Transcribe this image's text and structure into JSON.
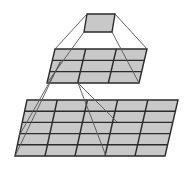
{
  "diagram": {
    "title": "",
    "colors": {
      "background": "#ffffff",
      "cell_fill": "#c8c8c8",
      "grid_line": "#2a2a2a",
      "connector_line": "#555555"
    },
    "layers": [
      {
        "name": "top-unit",
        "rows": 1,
        "cols": 1,
        "corners": {
          "tl": [
            87,
            14
          ],
          "tr": [
            115,
            14
          ],
          "br": [
            112,
            32
          ],
          "bl": [
            84,
            32
          ]
        }
      },
      {
        "name": "middle-layer",
        "rows": 3,
        "cols": 3,
        "corners": {
          "tl": [
            55,
            49
          ],
          "tr": [
            147,
            49
          ],
          "br": [
            139,
            83
          ],
          "bl": [
            47,
            83
          ]
        }
      },
      {
        "name": "bottom-layer",
        "rows": 5,
        "cols": 5,
        "corners": {
          "tl": [
            27,
            100
          ],
          "tr": [
            178,
            100
          ],
          "br": [
            165,
            156
          ],
          "bl": [
            15,
            156
          ]
        }
      }
    ],
    "connectors": [
      {
        "from": [
          87,
          14
        ],
        "to": [
          55,
          49
        ]
      },
      {
        "from": [
          115,
          14
        ],
        "to": [
          147,
          49
        ]
      },
      {
        "from": [
          84,
          32
        ],
        "to": [
          47,
          83
        ]
      },
      {
        "from": [
          112,
          32
        ],
        "to": [
          139,
          83
        ]
      },
      {
        "from": [
          62,
          60
        ],
        "to": [
          19,
          136
        ]
      },
      {
        "from": [
          60,
          62
        ],
        "to": [
          15,
          156
        ]
      },
      {
        "from": [
          78,
          83
        ],
        "to": [
          106,
          156
        ]
      },
      {
        "from": [
          78,
          83
        ],
        "to": [
          117,
          122
        ]
      }
    ]
  }
}
